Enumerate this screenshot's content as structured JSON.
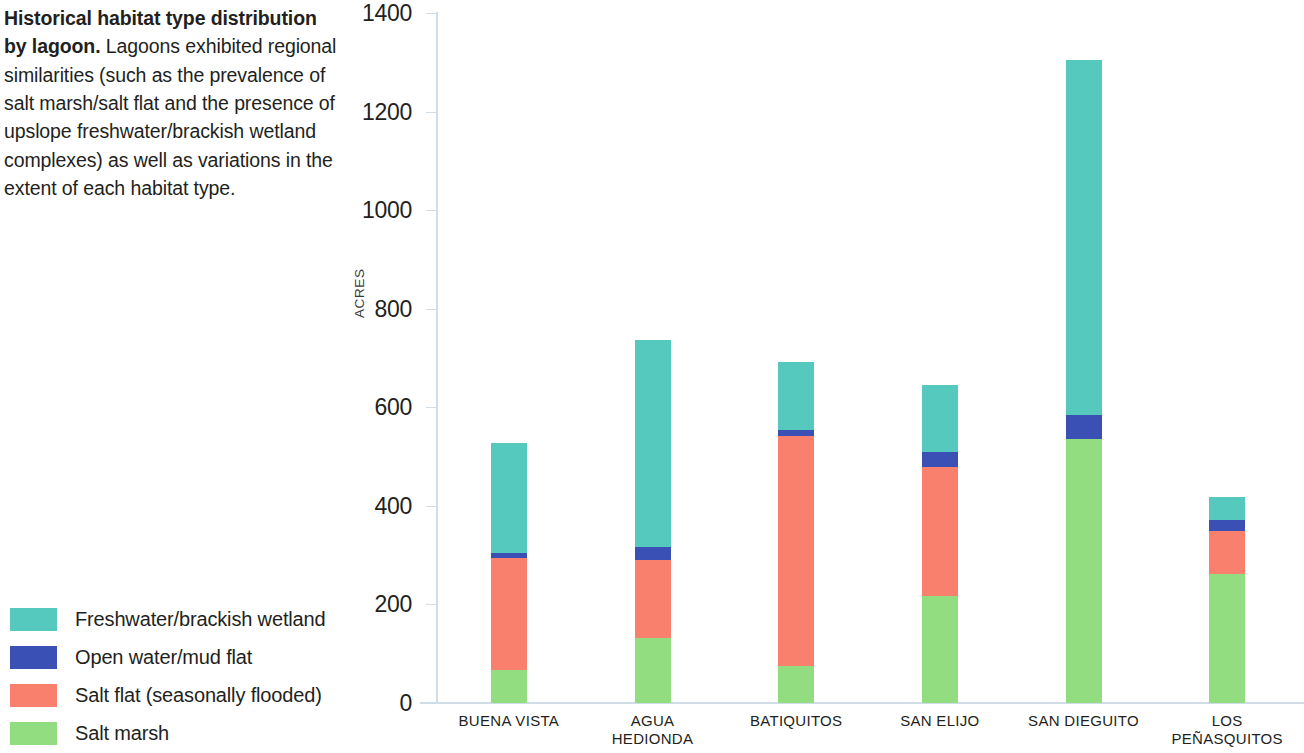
{
  "caption": {
    "lead": "Historical habitat type distribution by lagoon.",
    "body": " Lagoons exhibited regional similarities (such as the prevalence of salt marsh/salt flat and the presence of upslope freshwater/brackish wetland complexes) as well as variations in the extent of each habitat type."
  },
  "legend": {
    "items": [
      {
        "label": "Freshwater/brackish wetland",
        "color": "#55c9bd"
      },
      {
        "label": "Open water/mud flat",
        "color": "#3b50b5"
      },
      {
        "label": "Salt flat (seasonally flooded)",
        "color": "#f9806d"
      },
      {
        "label": "Salt marsh",
        "color": "#92dd7f"
      }
    ]
  },
  "chart_data": {
    "type": "bar",
    "stacked": true,
    "title": "Historical habitat type distribution by lagoon",
    "xlabel": "",
    "ylabel": "ACRES",
    "ylim": [
      0,
      1400
    ],
    "yticks": [
      0,
      200,
      400,
      600,
      800,
      1000,
      1200,
      1400
    ],
    "ytick_labels": [
      "0",
      "200",
      "400",
      "600",
      "800",
      "1000",
      "1200",
      "1400"
    ],
    "grid": false,
    "legend_position": "left-bottom",
    "axis_color": "#cfdde8",
    "categories": [
      "BUENA VISTA",
      "AGUA\nHEDIONDA",
      "BATIQUITOS",
      "SAN ELIJO",
      "SAN DIEGUITO",
      "LOS\nPEÑASQUITOS"
    ],
    "series": [
      {
        "name": "Salt marsh",
        "color": "#92dd7f",
        "values": [
          67,
          132,
          75,
          217,
          535,
          262
        ]
      },
      {
        "name": "Salt flat (seasonally flooded)",
        "color": "#f9806d",
        "values": [
          227,
          158,
          467,
          262,
          0,
          88
        ]
      },
      {
        "name": "Open water/mud flat",
        "color": "#3b50b5",
        "values": [
          10,
          26,
          12,
          30,
          50,
          22
        ]
      },
      {
        "name": "Freshwater/brackish wetland",
        "color": "#55c9bd",
        "values": [
          223,
          420,
          138,
          136,
          720,
          47
        ]
      }
    ],
    "totals": [
      527,
      736,
      692,
      645,
      1305,
      419
    ]
  }
}
